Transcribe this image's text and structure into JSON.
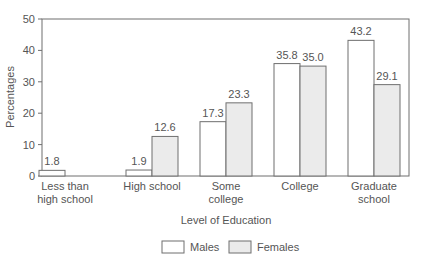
{
  "chart_data": {
    "type": "bar",
    "title": "",
    "xlabel": "Level of Education",
    "ylabel": "Percentages",
    "ylim": [
      0,
      50
    ],
    "yticks": [
      0,
      10,
      20,
      30,
      40,
      50
    ],
    "grid": false,
    "legend_position": "bottom",
    "categories": [
      [
        "Less than",
        "high school"
      ],
      [
        "High school"
      ],
      [
        "Some",
        "college"
      ],
      [
        "College"
      ],
      [
        "Graduate",
        "school"
      ]
    ],
    "series": [
      {
        "name": "Males",
        "values": [
          1.8,
          1.9,
          17.3,
          35.8,
          43.2
        ],
        "labels": [
          "1.8",
          "1.9",
          "17.3",
          "35.8",
          "43.2"
        ],
        "color": "#ffffff"
      },
      {
        "name": "Females",
        "values": [
          null,
          12.6,
          23.3,
          35.0,
          29.1
        ],
        "labels": [
          null,
          "12.6",
          "23.3",
          "35.0",
          "29.1"
        ],
        "color": "#ebebeb"
      }
    ]
  },
  "style": {
    "stroke": "#6f6f6f",
    "male_fill": "#ffffff",
    "female_fill": "#ebebeb"
  }
}
